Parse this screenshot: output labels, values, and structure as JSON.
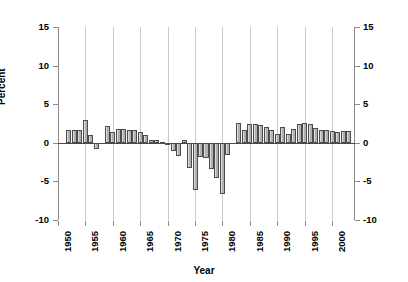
{
  "chart_data": {
    "type": "bar",
    "title": "",
    "xlabel": "Year",
    "ylabel": "Percent",
    "ylim": [
      -10,
      15
    ],
    "xlim": [
      1950,
      2004
    ],
    "ytick_labels_left": [
      "15",
      "10",
      "5",
      "0",
      "-5",
      "-10"
    ],
    "ytick_labels_right": [
      "15",
      "10",
      "5",
      "0",
      "-5",
      "-10"
    ],
    "ytick_values": [
      15,
      10,
      5,
      0,
      -5,
      -10
    ],
    "xtick_labels": [
      "1950",
      "1955",
      "1960",
      "1965",
      "1970",
      "1975",
      "1980",
      "1985",
      "1990",
      "1995",
      "2000"
    ],
    "xtick_values": [
      1950,
      1955,
      1960,
      1965,
      1970,
      1975,
      1980,
      1985,
      1990,
      1995,
      2000
    ],
    "grid": "vertical",
    "legend": "none",
    "bar_color": "#b0b0b0",
    "bar_edge_color": "#4d4d4d",
    "grid_color": "#c9c9c9",
    "axis_color": "#8a8a8a",
    "categories": [
      1952,
      1953,
      1954,
      1955,
      1956,
      1957,
      1958,
      1959,
      1960,
      1961,
      1962,
      1963,
      1964,
      1965,
      1966,
      1967,
      1968,
      1969,
      1970,
      1971,
      1972,
      1973,
      1974,
      1975,
      1976,
      1977,
      1978,
      1979,
      1980,
      1981,
      1982,
      1983,
      1984,
      1985,
      1986,
      1987,
      1988,
      1989,
      1990,
      1991,
      1992,
      1993,
      1994,
      1995,
      1996,
      1997,
      1998,
      1999,
      2000,
      2001,
      2002,
      2003
    ],
    "values": [
      1.6,
      1.7,
      1.6,
      2.9,
      1.0,
      -0.8,
      0.0,
      2.2,
      1.4,
      1.8,
      1.8,
      1.7,
      1.6,
      1.4,
      1.0,
      0.4,
      0.4,
      0.1,
      -0.3,
      -1.1,
      -1.7,
      0.3,
      -3.3,
      -6.1,
      -1.9,
      -2.0,
      -3.4,
      -4.6,
      -6.6,
      -1.6,
      0.0,
      2.6,
      1.7,
      2.4,
      2.5,
      2.3,
      2.0,
      1.6,
      1.2,
      2.1,
      1.2,
      1.8,
      2.5,
      2.6,
      2.5,
      1.9,
      1.6,
      1.6,
      1.5,
      1.4,
      1.5,
      1.5
    ]
  }
}
